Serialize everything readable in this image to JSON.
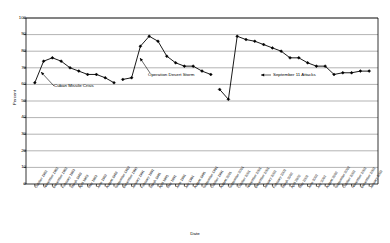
{
  "chart_data": {
    "type": "line",
    "title": "",
    "xlabel": "Date",
    "ylabel": "Percent",
    "ylim": [
      0,
      100
    ],
    "ytick_step": 10,
    "yticks": [
      0,
      10,
      20,
      30,
      40,
      50,
      60,
      70,
      80,
      90,
      100
    ],
    "grid": "horizontal",
    "legend": "none",
    "marker": "filled-diamond",
    "line_color": "#000000",
    "grid_color": "#808080",
    "axis_color": "#000000",
    "series": [
      {
        "name": "Presidential Approval",
        "points": [
          {
            "x": "October 1962",
            "y": 61
          },
          {
            "x": "November 1962",
            "y": 74
          },
          {
            "x": "December 1962",
            "y": 76
          },
          {
            "x": "February 1963",
            "y": 74
          },
          {
            "x": "March 1963",
            "y": 70
          },
          {
            "x": "April 1963",
            "y": 68
          },
          {
            "x": "May 1963",
            "y": 66
          },
          {
            "x": "June 1963",
            "y": 66
          },
          {
            "x": "August 1963",
            "y": 64
          },
          {
            "x": "September 1963",
            "y": 61
          },
          {
            "x": "December 1990",
            "y": 63
          },
          {
            "x": "January 1991",
            "y": 64
          },
          {
            "x": "February 1991",
            "y": 83
          },
          {
            "x": "March 1991",
            "y": 89
          },
          {
            "x": "April 1991",
            "y": 86
          },
          {
            "x": "May 1991",
            "y": 77
          },
          {
            "x": "June 1991",
            "y": 73
          },
          {
            "x": "July 1991",
            "y": 71
          },
          {
            "x": "August 1991",
            "y": 71
          },
          {
            "x": "September 1991",
            "y": 68
          },
          {
            "x": "October 1991",
            "y": 66
          },
          {
            "x": "August 2001",
            "y": 57
          },
          {
            "x": "September 2001",
            "y": 51
          },
          {
            "x": "October 2001",
            "y": 89
          },
          {
            "x": "November 2001",
            "y": 87
          },
          {
            "x": "December 2001",
            "y": 86
          },
          {
            "x": "January 2002",
            "y": 84
          },
          {
            "x": "February 2002",
            "y": 82
          },
          {
            "x": "March 2002",
            "y": 80
          },
          {
            "x": "April 2002",
            "y": 76
          },
          {
            "x": "May 2002",
            "y": 76
          },
          {
            "x": "June 2002",
            "y": 73
          },
          {
            "x": "July 2002",
            "y": 71
          },
          {
            "x": "August 2002",
            "y": 71
          },
          {
            "x": "September 2002",
            "y": 66
          },
          {
            "x": "October 2002",
            "y": 67
          },
          {
            "x": "November 2002",
            "y": 67
          },
          {
            "x": "December 2002",
            "y": 68
          },
          {
            "x": "January 2003",
            "y": 68
          }
        ]
      }
    ],
    "breaks": [
      10,
      21
    ],
    "xtick_labels": [
      "October 1962",
      "November 1962",
      "December 1962",
      "February 1963",
      "March 1963",
      "April 1963",
      "May 1963",
      "June 1963",
      "August 1963",
      "September 1963",
      "December 1990",
      "January 1991",
      "February 1991",
      "March 1991",
      "April 1991",
      "May 1991",
      "June 1991",
      "July 1991",
      "August 1991",
      "September 1991",
      "October 1991",
      "August 2001",
      "September 2001",
      "October 2001",
      "November 2001",
      "December 2001",
      "January 2002",
      "February 2002",
      "March 2002",
      "April 2002",
      "May 2002",
      "June 2002",
      "July 2002",
      "August 2002",
      "September 2002",
      "October 2002",
      "November 2002",
      "December 2002",
      "January 2003"
    ],
    "annotations": [
      {
        "label": "Cuban Missile Crisis",
        "target_index": 0
      },
      {
        "label": "Operation Desert Storm",
        "target_index": 13
      },
      {
        "label": "September 11 Attacks",
        "target_index": 23
      }
    ]
  }
}
